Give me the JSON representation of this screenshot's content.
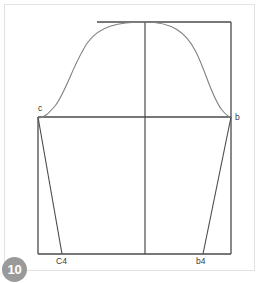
{
  "page": {
    "badge_number": "10",
    "background_color": "#ffffff",
    "frame_color": "#e2e2e2",
    "line_color": "#4a4a4a",
    "curve_color": "#7a7a7a",
    "badge_color": "#9a9a9a"
  },
  "diagram": {
    "labels": {
      "left_shoulder": "c",
      "right_shoulder": "b",
      "left_hem": "C4",
      "right_hem": "b4"
    },
    "points": {
      "c": {
        "x": 38,
        "y": 117
      },
      "b": {
        "x": 231,
        "y": 117
      },
      "C4": {
        "x": 62,
        "y": 254
      },
      "b4": {
        "x": 203,
        "y": 254
      },
      "apex": {
        "x": 145,
        "y": 22
      },
      "top_left": {
        "x": 97,
        "y": 22
      },
      "top_right": {
        "x": 231,
        "y": 22
      },
      "bottom_left": {
        "x": 38,
        "y": 254
      },
      "bottom_right": {
        "x": 231,
        "y": 254
      }
    },
    "construction_lines": [
      {
        "name": "top-horizontal",
        "x1": 97,
        "y1": 22,
        "x2": 231,
        "y2": 22
      },
      {
        "name": "center-vertical",
        "x1": 145,
        "y1": 22,
        "x2": 145,
        "y2": 254
      },
      {
        "name": "right-vertical",
        "x1": 231,
        "y1": 22,
        "x2": 231,
        "y2": 254
      },
      {
        "name": "biceps-horizontal",
        "x1": 38,
        "y1": 117,
        "x2": 231,
        "y2": 117
      },
      {
        "name": "left-vertical",
        "x1": 38,
        "y1": 117,
        "x2": 38,
        "y2": 254
      },
      {
        "name": "bottom-horizontal",
        "x1": 38,
        "y1": 254,
        "x2": 231,
        "y2": 254
      },
      {
        "name": "left-underarm-seam",
        "x1": 38,
        "y1": 117,
        "x2": 62,
        "y2": 254
      },
      {
        "name": "right-underarm-seam",
        "x1": 231,
        "y1": 117,
        "x2": 203,
        "y2": 254
      }
    ],
    "curve": {
      "name": "sleeve-cap-curve",
      "path": "M 38 118 C 44 118 48 114 55 106 C 66 92 74 62 88 42 C 100 26 118 22 145 22 C 172 22 186 32 196 52 C 206 72 212 98 222 110 C 226 115 229 117 231 117"
    }
  }
}
